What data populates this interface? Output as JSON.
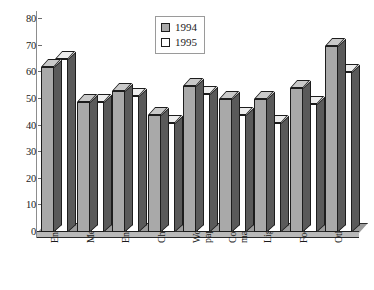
{
  "chart_data": {
    "type": "bar",
    "title": "",
    "subtitle": "",
    "xlabel": "",
    "ylabel": "",
    "ylim": [
      0,
      80
    ],
    "y_ticks": [
      0,
      10,
      20,
      30,
      40,
      50,
      60,
      70,
      80
    ],
    "grid": false,
    "legend_position": "top-center",
    "style": "3d-column",
    "categories": [
      "Energy",
      "Metals",
      "Engin.",
      "Chem.",
      "Wood,\npaper",
      "Constr.\nmaterials",
      "Light",
      "Food",
      "Other"
    ],
    "series": [
      {
        "name": "1994",
        "color": "#a9a9a9",
        "values": [
          62,
          49,
          53,
          44,
          55,
          50,
          50,
          54,
          70
        ]
      },
      {
        "name": "1995",
        "color": "#ffffff",
        "values": [
          65,
          49,
          51,
          41,
          52,
          44,
          41,
          48,
          60
        ]
      }
    ]
  },
  "legend": {
    "entries": [
      {
        "label": "1994",
        "swatch": "gray"
      },
      {
        "label": "1995",
        "swatch": "white"
      }
    ]
  }
}
